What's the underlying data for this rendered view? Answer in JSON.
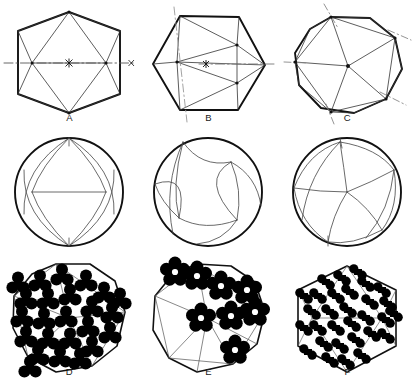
{
  "figure": {
    "background_color": "#ffffff",
    "ink_color": "#000000",
    "grid": {
      "rows": 3,
      "columns": 3,
      "panel_width": 139,
      "panel_height": 128
    }
  },
  "panels": [
    {
      "id": "A",
      "label": "A",
      "row": 0,
      "column": 0,
      "view": "two-fold",
      "outline": "hexagon",
      "axis_style": "dash-dot",
      "axis_orientation": "horizontal",
      "axis_marker": "asterisk",
      "description": "Icosahedron viewed down a 2-fold axis: hexagonal silhouette with internal triangular facet edges"
    },
    {
      "id": "B",
      "label": "B",
      "row": 0,
      "column": 1,
      "view": "three-fold",
      "outline": "hexagon",
      "axis_style": "dash-dot",
      "axis_orientation": "horizontal-and-diagonal",
      "axis_marker": "asterisk",
      "description": "Icosahedron viewed down a 3-fold axis: hexagonal silhouette with rotated internal triangulation"
    },
    {
      "id": "C",
      "label": "C",
      "row": 0,
      "column": 2,
      "view": "five-fold",
      "outline": "decagon",
      "axis_style": "dash-dot",
      "axis_orientation": "radial-five-fold",
      "axis_marker": "asterisk",
      "description": "Icosahedron viewed down a 5-fold axis: decagonal silhouette with five radial spokes"
    },
    {
      "id": "D",
      "label": "D",
      "row": 2,
      "column": 0,
      "view": "two-fold",
      "outline": "decagon",
      "capsomer_shape": "trefoil",
      "capsomer_fill": "#000000",
      "capsomer_count": 24,
      "description": "Capsomer arrangement on 2-fold view: trimeric clover-shaped subunits filling the shell"
    },
    {
      "id": "E",
      "label": "E",
      "row": 2,
      "column": 1,
      "view": "three-fold",
      "outline": "decagon",
      "capsomer_shape": "pentameric-flower",
      "capsomer_fill": "#000000",
      "capsomer_count": 8,
      "description": "Capsomer arrangement on 3-fold view: pentameric flower-shaped rings on the upper facets"
    },
    {
      "id": "F",
      "label": "F",
      "row": 2,
      "column": 2,
      "view": "five-fold",
      "outline": "hexagon",
      "capsomer_shape": "dimer-dot-pair",
      "capsomer_fill": "#000000",
      "capsomer_count": 30,
      "description": "Capsomer arrangement on 5-fold view: paired dots forming rings around hexagonal holes"
    }
  ],
  "projections": [
    {
      "id": "P1",
      "row": 1,
      "column": 0,
      "outline": "circle",
      "view": "two-fold",
      "description": "Spherical projection of the 2-fold view with great-circle facet boundaries"
    },
    {
      "id": "P2",
      "row": 1,
      "column": 1,
      "outline": "circle",
      "view": "three-fold",
      "description": "Spherical projection of the 3-fold view with curved facet boundaries"
    },
    {
      "id": "P3",
      "row": 1,
      "column": 2,
      "outline": "circle",
      "view": "five-fold",
      "description": "Spherical projection of the 5-fold view with five curved radial boundaries"
    }
  ]
}
